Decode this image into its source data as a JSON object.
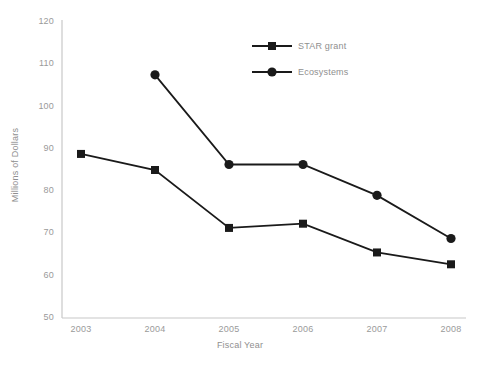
{
  "chart_data": {
    "type": "line",
    "title": "",
    "xlabel": "Fiscal Year",
    "ylabel": "Millions of Dollars",
    "categories": [
      "2003",
      "2004",
      "2005",
      "2006",
      "2007",
      "2008"
    ],
    "ylim": [
      50,
      120
    ],
    "yticks": [
      "50",
      "60",
      "70",
      "80",
      "90",
      "100",
      "110",
      "120"
    ],
    "grid": false,
    "legend_position": "top-center",
    "series": [
      {
        "name": "STAR grant",
        "marker": "square",
        "color": "#1a1a1a",
        "values": [
          88.8,
          85.0,
          71.3,
          72.3,
          65.5,
          62.7
        ]
      },
      {
        "name": "Ecosystems",
        "marker": "circle",
        "color": "#1a1a1a",
        "values": [
          null,
          107.5,
          86.3,
          86.3,
          79.0,
          68.8
        ]
      }
    ]
  },
  "legend": {
    "items": [
      {
        "label": "STAR grant",
        "marker": "square"
      },
      {
        "label": "Ecosystems",
        "marker": "circle"
      }
    ]
  },
  "colors": {
    "axis": "#c8c8c8",
    "tick_text": "#9a9a9a",
    "data": "#1a1a1a",
    "background": "#ffffff"
  }
}
